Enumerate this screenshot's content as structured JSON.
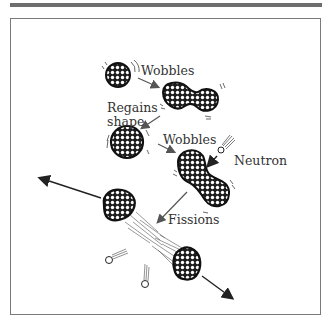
{
  "figure": {
    "labels": {
      "wobbles_1": "Wobbles",
      "regains_shape_1": "Regains",
      "regains_shape_2": "shape",
      "wobbles_2": "Wobbles",
      "neutron": "Neutron",
      "fissions": "Fissions"
    },
    "colors": {
      "frame": "#7a7a7a",
      "topbar": "#6e6e6e",
      "nucleus_fill": "#1e1e1e",
      "nucleon": "#ffffff",
      "arrow": "#555555",
      "text": "#333333"
    }
  }
}
